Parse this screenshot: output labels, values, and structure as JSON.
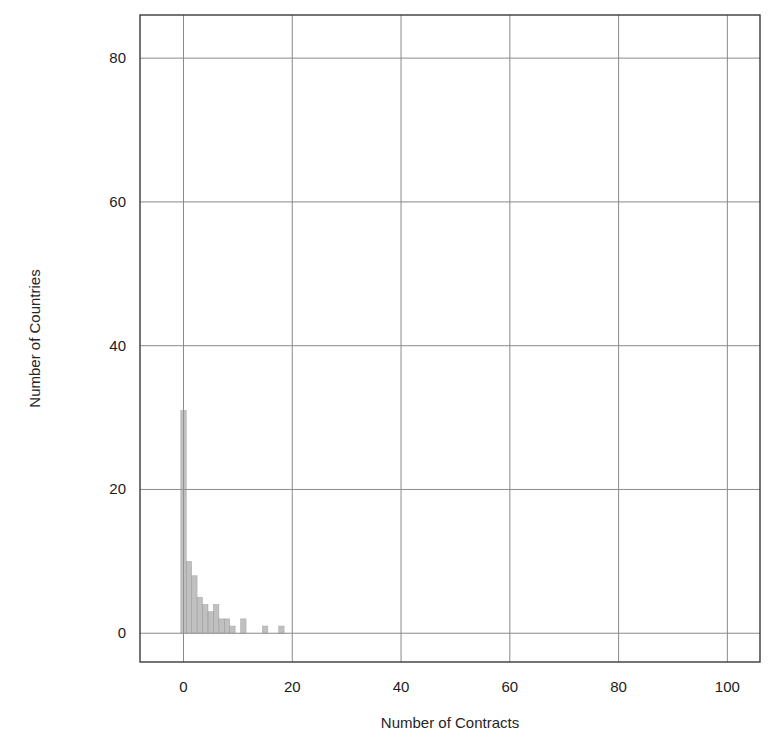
{
  "chart_data": {
    "type": "bar",
    "title": "",
    "subtitle": "",
    "xlabel": "Number of Contracts",
    "ylabel": "Number of Countries",
    "xlim": [
      -8,
      106
    ],
    "ylim": [
      -4,
      86
    ],
    "xticks": [
      0,
      20,
      40,
      60,
      80,
      100
    ],
    "xticklabels": [
      "0",
      "20",
      "40",
      "60",
      "80",
      "100"
    ],
    "yticks": [
      0,
      20,
      40,
      60,
      80
    ],
    "yticklabels": [
      "0",
      "20",
      "40",
      "60",
      "80"
    ],
    "grid": true,
    "legend": null,
    "bar_color": "#9a9a9a",
    "bin_width": 1,
    "categories": [
      0,
      1,
      2,
      3,
      4,
      5,
      6,
      7,
      8,
      9,
      10,
      11,
      12,
      13,
      14,
      15,
      16,
      17,
      18,
      19,
      20
    ],
    "values": [
      31,
      10,
      8,
      5,
      4,
      3,
      4,
      2,
      2,
      1,
      0,
      2,
      0,
      0,
      0,
      1,
      0,
      0,
      1,
      0,
      0
    ],
    "series": [
      {
        "name": "Countries",
        "values": [
          31,
          10,
          8,
          5,
          4,
          3,
          4,
          2,
          2,
          1,
          0,
          2,
          0,
          0,
          0,
          1,
          0,
          0,
          1,
          0,
          0
        ]
      }
    ],
    "annotations": []
  },
  "axes": {
    "frame_color": "#3a3a3a",
    "grid_color": "#8a8a8a"
  }
}
